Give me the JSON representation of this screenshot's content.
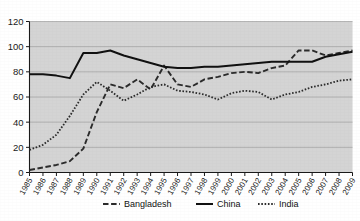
{
  "chart_data": {
    "type": "line",
    "title": "",
    "xlabel": "",
    "ylabel": "",
    "ylim": [
      0,
      120
    ],
    "yticks": [
      0,
      20,
      40,
      60,
      80,
      100,
      120
    ],
    "grid": true,
    "legend_position": "bottom",
    "plot_background": "#d4d4d4",
    "categories": [
      "1985",
      "1986",
      "1987",
      "1988",
      "1989",
      "1990",
      "1991",
      "1992",
      "1993",
      "1994",
      "1995",
      "1996",
      "1997",
      "1998",
      "1999",
      "2000",
      "2001",
      "2002",
      "2003",
      "2004",
      "2005",
      "2006",
      "2007",
      "2008",
      "2009"
    ],
    "series": [
      {
        "name": "Bangladesh",
        "style": "dashed",
        "color": "#2b2b2b",
        "values": [
          2,
          4,
          6,
          9,
          19,
          48,
          70,
          67,
          74,
          66,
          85,
          70,
          68,
          74,
          76,
          79,
          80,
          79,
          83,
          85,
          97,
          97,
          93,
          95,
          97
        ]
      },
      {
        "name": "China",
        "style": "solid",
        "color": "#111111",
        "values": [
          78,
          78,
          77,
          75,
          95,
          95,
          97,
          93,
          90,
          87,
          84,
          83,
          83,
          84,
          84,
          85,
          86,
          87,
          88,
          88,
          88,
          88,
          92,
          94,
          96
        ]
      },
      {
        "name": "India",
        "style": "dotted",
        "color": "#2b2b2b",
        "values": [
          18,
          22,
          30,
          45,
          62,
          72,
          65,
          57,
          62,
          68,
          70,
          65,
          64,
          62,
          58,
          63,
          65,
          64,
          58,
          62,
          64,
          68,
          70,
          73,
          74
        ]
      }
    ]
  },
  "legend": {
    "items": [
      {
        "label": "Bangladesh",
        "style": "dashed"
      },
      {
        "label": "China",
        "style": "solid"
      },
      {
        "label": "India",
        "style": "dotted"
      }
    ]
  },
  "axes": {
    "y_tick_labels": [
      "120",
      "100",
      "80",
      "60",
      "40",
      "20",
      "0"
    ],
    "x_tick_labels": [
      "1985",
      "1986",
      "1987",
      "1988",
      "1989",
      "1990",
      "1991",
      "1992",
      "1993",
      "1994",
      "1995",
      "1996",
      "1997",
      "1998",
      "1999",
      "2000",
      "2001",
      "2002",
      "2003",
      "2004",
      "2005",
      "2006",
      "2007",
      "2008",
      "2009"
    ]
  }
}
